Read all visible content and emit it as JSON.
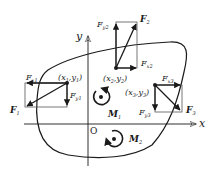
{
  "diagram": {
    "type": "rigid-body force diagram",
    "axes": {
      "x_label": "x",
      "y_label": "y",
      "origin_label": "O"
    },
    "forces": [
      {
        "point_label": "(x1,y1)",
        "point_x": "x",
        "point_x_sub": "1",
        "point_y": "y",
        "point_y_sub": "1",
        "resultant": "F",
        "resultant_sub": "1",
        "fx": "F",
        "fx_sub": "x1",
        "fy": "F",
        "fy_sub": "y1"
      },
      {
        "point_label": "(x2,y2)",
        "point_x": "x",
        "point_x_sub": "2",
        "point_y": "y",
        "point_y_sub": "2",
        "resultant": "F",
        "resultant_sub": "2",
        "fx": "F",
        "fx_sub": "x2",
        "fy": "F",
        "fy_sub": "y2"
      },
      {
        "point_label": "(x3,y3)",
        "point_x": "x",
        "point_x_sub": "3",
        "point_y": "y",
        "point_y_sub": "3",
        "resultant": "F",
        "resultant_sub": "3",
        "fx": "F",
        "fx_sub": "x3",
        "fy": "F",
        "fy_sub": "y3"
      }
    ],
    "moments": [
      {
        "label": "M",
        "sub": "1",
        "direction": "counterclockwise"
      },
      {
        "label": "M",
        "sub": "2",
        "direction": "counterclockwise"
      }
    ],
    "colors": {
      "ink": "#1a1a1a",
      "box": "#555555",
      "background": "#ffffff"
    }
  }
}
